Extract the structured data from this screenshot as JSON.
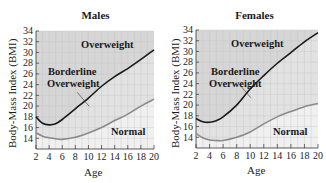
{
  "chart_data": [
    {
      "type": "line",
      "title": "Males",
      "xlabel": "Age",
      "ylabel": "Body-Mass Index (BMI)",
      "xlim": [
        2,
        20
      ],
      "ylim": [
        12,
        34
      ],
      "x_ticks": [
        2,
        4,
        6,
        8,
        10,
        12,
        14,
        16,
        18,
        20
      ],
      "y_ticks": [
        14,
        16,
        18,
        20,
        22,
        24,
        26,
        28,
        30,
        32,
        34
      ],
      "grid": true,
      "x": [
        2,
        3,
        4,
        5,
        6,
        8,
        10,
        12,
        14,
        16,
        18,
        20
      ],
      "series": [
        {
          "name": "Overweight threshold",
          "color": "#1a1a1a",
          "values": [
            18.0,
            16.8,
            16.5,
            16.7,
            17.5,
            19.5,
            21.5,
            23.7,
            25.5,
            27.0,
            28.7,
            30.5
          ]
        },
        {
          "name": "Normal threshold",
          "color": "#8a8a8a",
          "values": [
            15.0,
            14.4,
            14.1,
            13.9,
            13.8,
            14.2,
            15.0,
            16.0,
            17.3,
            18.5,
            20.0,
            21.3
          ]
        }
      ],
      "region_labels": [
        "Overweight",
        "Borderline Overweight",
        "Normal"
      ]
    },
    {
      "type": "line",
      "title": "Females",
      "xlabel": "Age",
      "ylabel": "Body-Mass Index (BMI)",
      "xlim": [
        2,
        20
      ],
      "ylim": [
        12,
        34
      ],
      "x_ticks": [
        2,
        4,
        6,
        8,
        10,
        12,
        14,
        16,
        18,
        20
      ],
      "y_ticks": [
        14,
        16,
        18,
        20,
        22,
        24,
        26,
        28,
        30,
        32,
        34
      ],
      "grid": true,
      "x": [
        2,
        3,
        4,
        5,
        6,
        8,
        10,
        12,
        14,
        16,
        18,
        20
      ],
      "series": [
        {
          "name": "Overweight threshold",
          "color": "#1a1a1a",
          "values": [
            17.5,
            16.9,
            16.8,
            17.1,
            17.8,
            20.0,
            23.0,
            25.5,
            27.8,
            29.8,
            31.8,
            33.5
          ]
        },
        {
          "name": "Normal threshold",
          "color": "#8a8a8a",
          "values": [
            14.7,
            13.9,
            13.5,
            13.4,
            13.4,
            14.0,
            15.0,
            16.5,
            17.8,
            18.8,
            19.7,
            20.3
          ]
        }
      ],
      "region_labels": [
        "Overweight",
        "Borderline Overweight",
        "Normal"
      ]
    }
  ],
  "panels": [
    {
      "title": "Males",
      "ylabel": "Body-Mass Index (BMI)",
      "xlabel": "Age",
      "labels": {
        "overweight": "Overweight",
        "borderline1": "Borderline",
        "borderline2": "Overweight",
        "normal": "Normal"
      }
    },
    {
      "title": "Females",
      "ylabel": "Body-Mass Index (BMI)",
      "xlabel": "Age",
      "labels": {
        "overweight": "Overweight",
        "borderline1": "Borderline",
        "borderline2": "Overweight",
        "normal": "Normal"
      }
    }
  ],
  "colors": {
    "overweight_bg": "#d6d6d6",
    "borderline_bg": "#e2e2e2",
    "normal_bg": "#f0f0f0",
    "grid": "#c4c4c4",
    "upper_curve": "#1a1a1a",
    "lower_curve": "#8a8a8a"
  }
}
